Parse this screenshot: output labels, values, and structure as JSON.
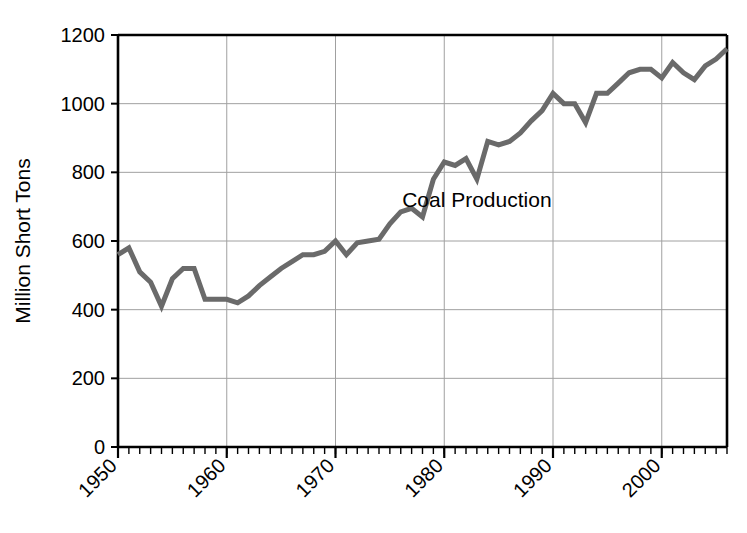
{
  "figure": {
    "background_color": "#ffffff",
    "series_color": "#6a6a6a",
    "axis_color": "#000000",
    "grid_color": "#a0a0a0",
    "annotation_label": "Coal Production",
    "caption_fragment": ""
  },
  "axes": {
    "ylabel": "Million Short Tons",
    "xlabel": "",
    "y_ticks": [
      "0",
      "200",
      "400",
      "600",
      "800",
      "1000",
      "1200"
    ],
    "x_ticks": [
      "1950",
      "1960",
      "1970",
      "1980",
      "1990",
      "2000"
    ]
  },
  "chart_data": {
    "type": "line",
    "title": "",
    "xlabel": "",
    "ylabel": "Million Short Tons",
    "xlim": [
      1950,
      2006
    ],
    "ylim": [
      0,
      1200
    ],
    "grid": true,
    "legend_position": "inline-annotation",
    "annotations": [
      {
        "text": "Coal Production",
        "x": 1983,
        "y": 700
      }
    ],
    "series": [
      {
        "name": "Coal Production",
        "color": "#6a6a6a",
        "x": [
          1950,
          1951,
          1952,
          1953,
          1954,
          1955,
          1956,
          1957,
          1958,
          1959,
          1960,
          1961,
          1962,
          1963,
          1964,
          1965,
          1966,
          1967,
          1968,
          1969,
          1970,
          1971,
          1972,
          1973,
          1974,
          1975,
          1976,
          1977,
          1978,
          1979,
          1980,
          1981,
          1982,
          1983,
          1984,
          1985,
          1986,
          1987,
          1988,
          1989,
          1990,
          1991,
          1992,
          1993,
          1994,
          1995,
          1996,
          1997,
          1998,
          1999,
          2000,
          2001,
          2002,
          2003,
          2004,
          2005,
          2006
        ],
        "y": [
          560,
          580,
          510,
          480,
          410,
          490,
          520,
          520,
          430,
          430,
          430,
          420,
          440,
          470,
          495,
          520,
          540,
          560,
          560,
          570,
          600,
          560,
          595,
          600,
          605,
          650,
          685,
          695,
          670,
          780,
          830,
          820,
          840,
          780,
          890,
          880,
          890,
          915,
          950,
          980,
          1030,
          1000,
          1000,
          945,
          1030,
          1030,
          1060,
          1090,
          1100,
          1100,
          1075,
          1120,
          1090,
          1070,
          1110,
          1130,
          1160
        ]
      }
    ]
  }
}
